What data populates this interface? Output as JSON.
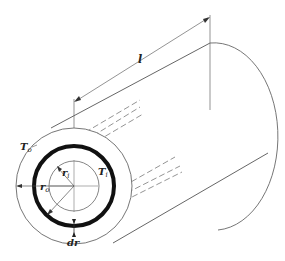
{
  "figure": {
    "type": "cylindrical shell heat conduction diagram",
    "labels": {
      "length": "l",
      "outer_temp": "T",
      "outer_temp_sub": "o",
      "inner_temp": "T",
      "inner_temp_sub": "i",
      "outer_radius": "r",
      "outer_radius_sub": "o",
      "inner_radius": "r",
      "inner_radius_sub": "i",
      "shell_thickness": "dr"
    },
    "colors": {
      "line": "#555555",
      "thick_ring": "#111111",
      "text": "#222222",
      "background": "#ffffff"
    }
  }
}
